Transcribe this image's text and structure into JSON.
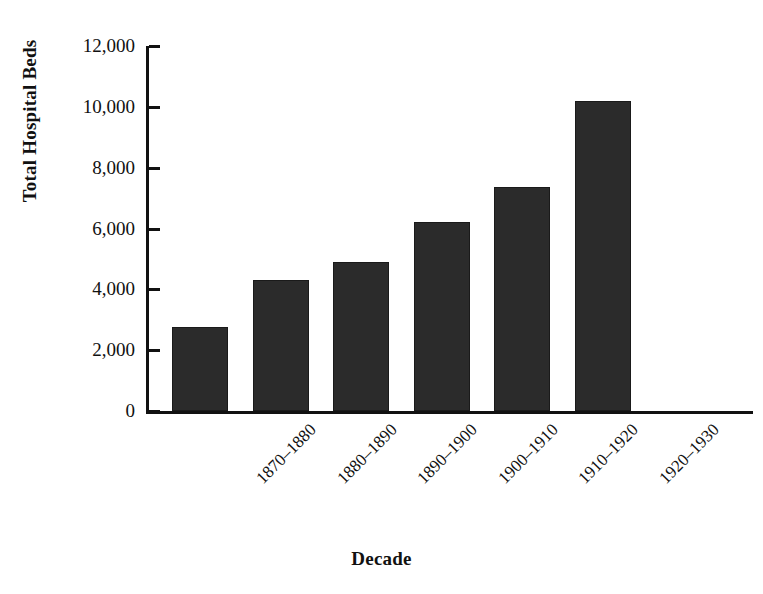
{
  "chart_data": {
    "type": "bar",
    "title": "",
    "subtitle": "",
    "xlabel": "Decade",
    "ylabel": "Total Hospital Beds",
    "categories": [
      "1870–1880",
      "1880–1890",
      "1890–1900",
      "1900–1910",
      "1910–1920",
      "1920–1930"
    ],
    "values": [
      2750,
      4300,
      4900,
      6200,
      7350,
      10200
    ],
    "ylim": [
      0,
      12000
    ],
    "ytick_labels": [
      "12,000",
      "10,000",
      "8,000",
      "6,000",
      "4,000",
      "2,000",
      "0"
    ],
    "ytick_values": [
      12000,
      10000,
      8000,
      6000,
      4000,
      2000,
      0
    ],
    "grid": false,
    "legend": false,
    "legend_position": "none",
    "bar_color": "#2b2b2b",
    "axis_color": "#111111",
    "background_color": "#ffffff"
  },
  "axes": {
    "y_title": "Total Hospital Beds",
    "x_title": "Decade"
  }
}
